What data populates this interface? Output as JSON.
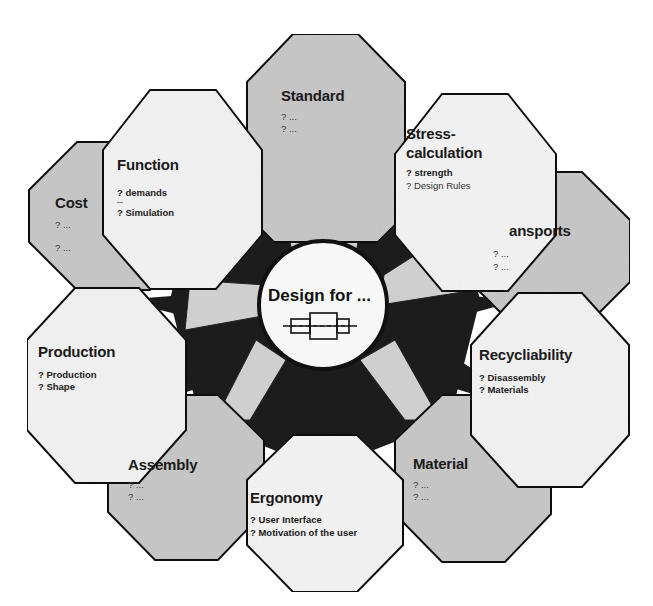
{
  "center": {
    "label": "Design for ...",
    "icon": "shaft-bearing-icon"
  },
  "colors": {
    "star": "#1c1c1c",
    "gray_fill": "#c9c9c9",
    "white_fill": "#f4f4f4",
    "connector": "#d2d2d2",
    "outline": "#111111"
  },
  "nodes": [
    {
      "id": "standard",
      "title": "Standard",
      "items": [
        "? ...",
        "? ..."
      ],
      "fill": "gray"
    },
    {
      "id": "stress",
      "title_line1": "Stress-",
      "title_line2": "calculation",
      "items": [
        "? strength",
        "? Design Rules"
      ],
      "fill": "white"
    },
    {
      "id": "transports",
      "title": "ansports",
      "items": [
        "? ...",
        "? ..."
      ],
      "fill": "gray"
    },
    {
      "id": "recyclability",
      "title": "Recycliability",
      "items": [
        "? Disassembly",
        "? Materials"
      ],
      "fill": "white"
    },
    {
      "id": "material",
      "title": "Material",
      "items": [
        "? ...",
        "? ..."
      ],
      "fill": "gray"
    },
    {
      "id": "ergonomy",
      "title": "Ergonomy",
      "items": [
        "? User Interface",
        "? Motivation of the user"
      ],
      "fill": "white"
    },
    {
      "id": "assembly",
      "title": "Assembly",
      "items": [
        "? ...",
        "? ..."
      ],
      "fill": "gray"
    },
    {
      "id": "production",
      "title": "Production",
      "items": [
        "? Production",
        "? Shape"
      ],
      "fill": "white"
    },
    {
      "id": "cost",
      "title": "Cost",
      "items": [
        "? ...",
        "? ..."
      ],
      "fill": "gray"
    },
    {
      "id": "function",
      "title": "Function",
      "items": [
        "? demands",
        "...",
        "? Simulation"
      ],
      "fill": "white"
    }
  ]
}
